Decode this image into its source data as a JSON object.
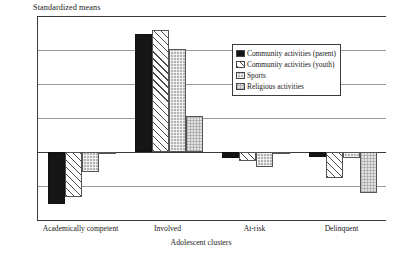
{
  "chart_data": {
    "type": "bar",
    "title": "",
    "ylabel": "Standardized means",
    "xlabel": "Adolescent clusters",
    "categories": [
      "Academically competent",
      "Involved",
      "At-risk",
      "Delinquent"
    ],
    "series": [
      {
        "name": "Community activities (parent)",
        "values": [
          -0.46,
          1.04,
          -0.05,
          -0.04
        ]
      },
      {
        "name": "Community activities (youth)",
        "values": [
          -0.4,
          1.08,
          -0.08,
          -0.23
        ]
      },
      {
        "name": "Sports",
        "values": [
          -0.18,
          0.91,
          -0.13,
          -0.05
        ]
      },
      {
        "name": "Religious activities",
        "values": [
          -0.01,
          0.32,
          -0.02,
          -0.36
        ]
      }
    ],
    "ylim": [
      -0.6,
      1.2
    ],
    "yticks": [
      "1.2",
      "0.9",
      "0.6",
      "0.3",
      "0",
      "-0.3",
      "-0.6"
    ],
    "ytick_values": [
      1.2,
      0.9,
      0.6,
      0.3,
      0,
      -0.3,
      -0.6
    ],
    "grid": true,
    "legend_position": "upper right"
  },
  "legend": {
    "items": [
      {
        "label": "Community activities (parent)",
        "swatch": "solid-black"
      },
      {
        "label": "Community activities (youth)",
        "swatch": "diagonal-hatch"
      },
      {
        "label": "Sports",
        "swatch": "gray-crosshatch"
      },
      {
        "label": "Religious activities",
        "swatch": "light-crosshatch"
      }
    ]
  }
}
